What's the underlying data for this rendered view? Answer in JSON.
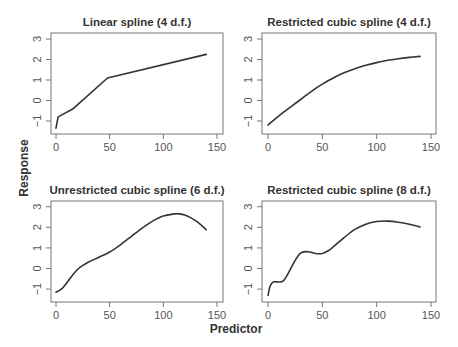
{
  "figure": {
    "ylabel": "Response",
    "xlabel": "Predictor",
    "colors": {
      "line": "#333333",
      "frame": "#777777",
      "text": "#333333"
    }
  },
  "chart_data": [
    {
      "type": "line",
      "title": "Linear spline (4 d.f.)",
      "xlabel": "Predictor",
      "ylabel": "Response",
      "xlim": [
        0,
        150
      ],
      "ylim": [
        -1.6,
        3.3
      ],
      "xticks": [
        0,
        50,
        100,
        150
      ],
      "yticks": [
        -1,
        0,
        1,
        2,
        3
      ],
      "grid": false,
      "x": [
        0,
        2,
        16,
        48,
        140
      ],
      "y": [
        -1.35,
        -0.8,
        -0.4,
        1.1,
        2.25
      ]
    },
    {
      "type": "line",
      "title": "Restricted cubic spline (4 d.f.)",
      "xlabel": "Predictor",
      "ylabel": "Response",
      "xlim": [
        0,
        150
      ],
      "ylim": [
        -1.6,
        3.3
      ],
      "xticks": [
        0,
        50,
        100,
        150
      ],
      "yticks": [
        -1,
        0,
        1,
        2,
        3
      ],
      "grid": false,
      "x": [
        0,
        10,
        20,
        30,
        40,
        50,
        60,
        70,
        80,
        90,
        100,
        110,
        120,
        130,
        140
      ],
      "y": [
        -1.2,
        -0.75,
        -0.35,
        0.05,
        0.45,
        0.8,
        1.1,
        1.35,
        1.55,
        1.72,
        1.85,
        1.96,
        2.04,
        2.1,
        2.15
      ]
    },
    {
      "type": "line",
      "title": "Unrestricted cubic spline (6 d.f.)",
      "xlabel": "Predictor",
      "ylabel": "Response",
      "xlim": [
        0,
        150
      ],
      "ylim": [
        -1.6,
        3.3
      ],
      "xticks": [
        0,
        50,
        100,
        150
      ],
      "yticks": [
        -1,
        0,
        1,
        2,
        3
      ],
      "grid": false,
      "x": [
        0,
        5,
        10,
        15,
        20,
        25,
        30,
        40,
        50,
        60,
        70,
        80,
        90,
        100,
        110,
        115,
        120,
        125,
        130,
        135,
        140
      ],
      "y": [
        -1.15,
        -1.0,
        -0.7,
        -0.35,
        -0.05,
        0.15,
        0.3,
        0.55,
        0.8,
        1.15,
        1.55,
        1.95,
        2.3,
        2.55,
        2.65,
        2.65,
        2.6,
        2.48,
        2.32,
        2.12,
        1.88
      ]
    },
    {
      "type": "line",
      "title": "Restricted cubic spline (8 d.f.)",
      "xlabel": "Predictor",
      "ylabel": "Response",
      "xlim": [
        0,
        150
      ],
      "ylim": [
        -1.6,
        3.3
      ],
      "xticks": [
        0,
        50,
        100,
        150
      ],
      "yticks": [
        -1,
        0,
        1,
        2,
        3
      ],
      "grid": false,
      "x": [
        0,
        2,
        5,
        8,
        12,
        15,
        20,
        25,
        30,
        35,
        40,
        45,
        50,
        55,
        60,
        70,
        80,
        90,
        100,
        110,
        120,
        130,
        140
      ],
      "y": [
        -1.3,
        -0.85,
        -0.65,
        -0.65,
        -0.65,
        -0.55,
        -0.1,
        0.4,
        0.75,
        0.82,
        0.78,
        0.72,
        0.73,
        0.85,
        1.05,
        1.5,
        1.9,
        2.15,
        2.28,
        2.3,
        2.25,
        2.15,
        2.02
      ]
    }
  ]
}
